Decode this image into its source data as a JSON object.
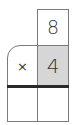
{
  "problem": {
    "type": "multiplication",
    "multiplicand": "8",
    "operator": "×",
    "multiplier": "4",
    "answer_cells": [
      "",
      ""
    ]
  },
  "colors": {
    "border": "#7a7a7a",
    "rule": "#2a2a2a",
    "shaded": "#d6d6d6",
    "text": "#333333"
  }
}
